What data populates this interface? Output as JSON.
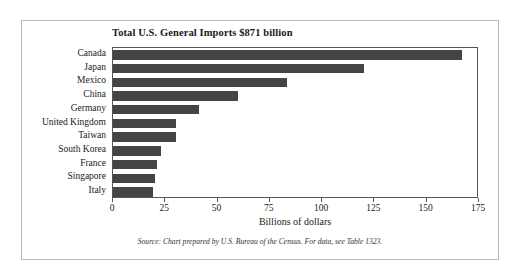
{
  "chart_data": {
    "type": "bar",
    "orientation": "horizontal",
    "title": "Total U.S. General Imports $871 billion",
    "xlabel": "Billions of dollars",
    "ylabel": "",
    "xlim": [
      0,
      175
    ],
    "xticks": [
      0,
      25,
      50,
      75,
      100,
      125,
      150,
      175
    ],
    "xtick_labels": [
      "0",
      "25",
      "50",
      "75",
      "100",
      "125",
      "150",
      "175"
    ],
    "grid": false,
    "legend": null,
    "categories": [
      "Canada",
      "Japan",
      "Mexico",
      "China",
      "Germany",
      "United Kingdom",
      "Taiwan",
      "South Korea",
      "France",
      "Singapore",
      "Italy"
    ],
    "values": [
      167,
      120,
      83,
      60,
      41,
      30,
      30,
      23,
      21,
      20,
      19
    ],
    "bar_color": "#444444",
    "source_note": "Source: Chart prepared by U.S. Bureau of the Census. For data, see Table 1323."
  },
  "colors": {
    "bar": "#444444",
    "axis": "#555555",
    "frame": "#b9b9b9",
    "text": "#1a1a1a",
    "background": "#ffffff"
  }
}
